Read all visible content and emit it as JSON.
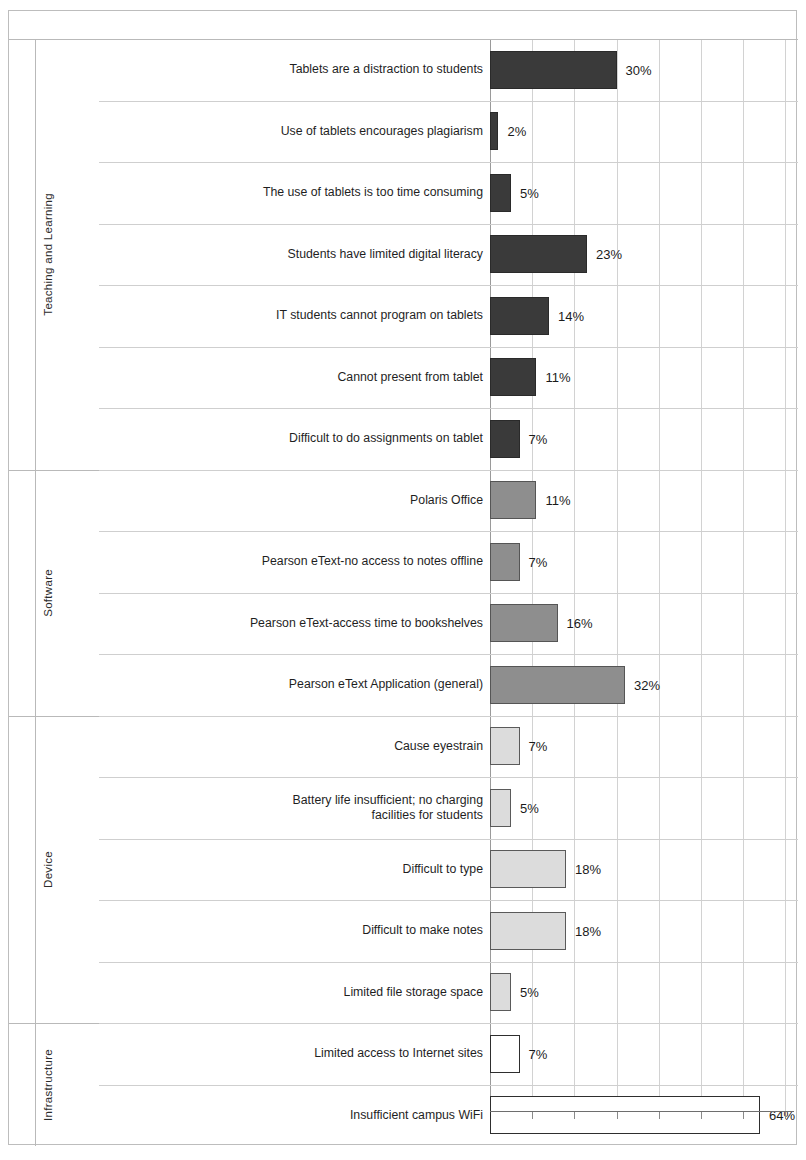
{
  "chart_data": {
    "type": "bar",
    "orientation": "horizontal",
    "title": "",
    "xlabel": "",
    "ylabel": "",
    "xlim": [
      0,
      70
    ],
    "grid": true,
    "gridline_step": 10,
    "value_suffix": "%",
    "legend": [],
    "groups": [
      {
        "name": "Teaching and Learning",
        "color": "#3a3a3a",
        "style_key": "teaching",
        "items": [
          {
            "label": "Tablets are a distraction to students",
            "value": 30,
            "value_label": "30%"
          },
          {
            "label": "Use of tablets encourages plagiarism",
            "value": 2,
            "value_label": "2%"
          },
          {
            "label": "The use of tablets is too time consuming",
            "value": 5,
            "value_label": "5%"
          },
          {
            "label": "Students have limited digital literacy",
            "value": 23,
            "value_label": "23%"
          },
          {
            "label": "IT students cannot program on tablets",
            "value": 14,
            "value_label": "14%"
          },
          {
            "label": "Cannot present from tablet",
            "value": 11,
            "value_label": "11%"
          },
          {
            "label": "Difficult to do assignments on tablet",
            "value": 7,
            "value_label": "7%"
          }
        ]
      },
      {
        "name": "Software",
        "color": "#8e8e8e",
        "style_key": "software",
        "items": [
          {
            "label": "Polaris Office",
            "value": 11,
            "value_label": "11%"
          },
          {
            "label": "Pearson eText-no access to notes offline",
            "value": 7,
            "value_label": "7%"
          },
          {
            "label": "Pearson eText-access time to bookshelves",
            "value": 16,
            "value_label": "16%"
          },
          {
            "label": "Pearson eText Application (general)",
            "value": 32,
            "value_label": "32%"
          }
        ]
      },
      {
        "name": "Device",
        "color": "#dcdcdc",
        "style_key": "device",
        "items": [
          {
            "label": "Cause eyestrain",
            "value": 7,
            "value_label": "7%"
          },
          {
            "label": "Battery life insufficient; no charging\nfacilities for students",
            "value": 5,
            "value_label": "5%"
          },
          {
            "label": "Difficult to type",
            "value": 18,
            "value_label": "18%"
          },
          {
            "label": "Difficult to make notes",
            "value": 18,
            "value_label": "18%"
          },
          {
            "label": "Limited file storage space",
            "value": 5,
            "value_label": "5%"
          }
        ]
      },
      {
        "name": "Infrastructure",
        "color": "#ffffff",
        "style_key": "infra",
        "items": [
          {
            "label": "Limited access to Internet sites",
            "value": 7,
            "value_label": "7%"
          },
          {
            "label": "Insufficient campus WiFi",
            "value": 64,
            "value_label": "64%"
          }
        ]
      }
    ]
  }
}
